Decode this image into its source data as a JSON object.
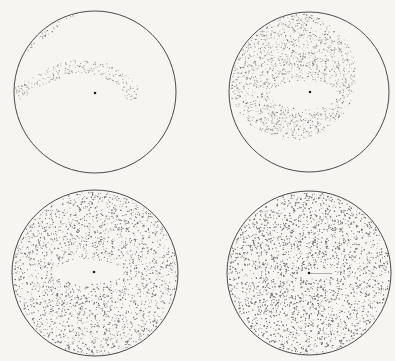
{
  "figure": {
    "colors": {
      "paper": "#f6f5f1",
      "rim": "#4a4a4a",
      "stipple": "#6a6a6a",
      "center_dot": "#1e1e1e"
    },
    "panels": [
      {
        "id": "panel-top-left",
        "center": [
          95,
          92
        ],
        "radius": 81,
        "center_dot": [
          95,
          93
        ],
        "stipple": {
          "kind": "arc-band",
          "density": 0.16,
          "band": {
            "path_points": [
              [
                20,
                92
              ],
              [
                40,
                78
              ],
              [
                75,
                66
              ],
              [
                105,
                70
              ],
              [
                125,
                82
              ],
              [
                133,
                92
              ]
            ],
            "thickness": 14
          },
          "blob": {
            "center": [
              131,
              93
            ],
            "radius": 7
          },
          "rim_crescent": {
            "from_deg": 200,
            "to_deg": 265,
            "thickness": 8
          }
        }
      },
      {
        "id": "panel-top-right",
        "center": [
          309,
          92
        ],
        "radius": 80,
        "center_dot": [
          310,
          92
        ],
        "stipple": {
          "kind": "disc-with-hole",
          "density": 0.2,
          "disc": {
            "center": [
              292,
              76
            ],
            "radius": 64
          },
          "hole": {
            "center": [
              304,
              95
            ],
            "rx": 34,
            "ry": 14
          }
        }
      },
      {
        "id": "panel-bottom-left",
        "center": [
          95,
          273
        ],
        "radius": 83,
        "center_dot": [
          94,
          272
        ],
        "stipple": {
          "kind": "full-with-hole",
          "density": 0.26,
          "hole": {
            "center": [
              88,
              272
            ],
            "rx": 35,
            "ry": 12
          }
        }
      },
      {
        "id": "panel-bottom-right",
        "center": [
          309,
          273
        ],
        "radius": 82,
        "center_dot": [
          309,
          273
        ],
        "stipple": {
          "kind": "full-with-hole",
          "density": 0.34,
          "hole": {
            "center": [
              317,
              274
            ],
            "rx": 17,
            "ry": 5
          }
        }
      }
    ]
  }
}
